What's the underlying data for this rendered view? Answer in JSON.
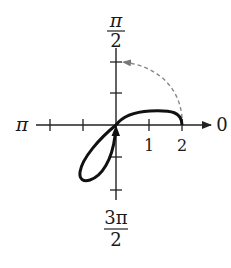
{
  "figure": {
    "type": "polar-graph",
    "axis_labels": {
      "top_numerator": "π",
      "top_denominator": "2",
      "left": "π",
      "right": "0",
      "bottom_numerator": "3π",
      "bottom_denominator": "2"
    },
    "tick_labels": [
      "1",
      "2"
    ],
    "colors": {
      "curve": "#111111",
      "axis": "#222222",
      "dashed_arc": "#888888"
    }
  }
}
